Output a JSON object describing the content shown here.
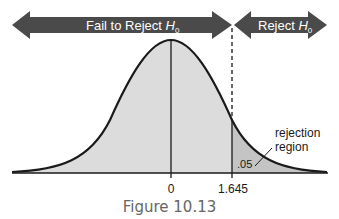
{
  "diagram": {
    "left_arrow_label": "Fail to Reject ",
    "right_arrow_label": "Reject ",
    "h_symbol": "H",
    "h_subscript": "0",
    "region_label_line1": "rejection",
    "region_label_line2": "region",
    "alpha_label": ".05",
    "axis_labels": [
      "0",
      "1.645"
    ],
    "colors": {
      "arrow_fill": "#4a4a4a",
      "curve_fill": "#dcdcdc",
      "tail_fill": "#c8c8c8",
      "line": "#1a1a1a"
    }
  },
  "caption": "Figure 10.13"
}
